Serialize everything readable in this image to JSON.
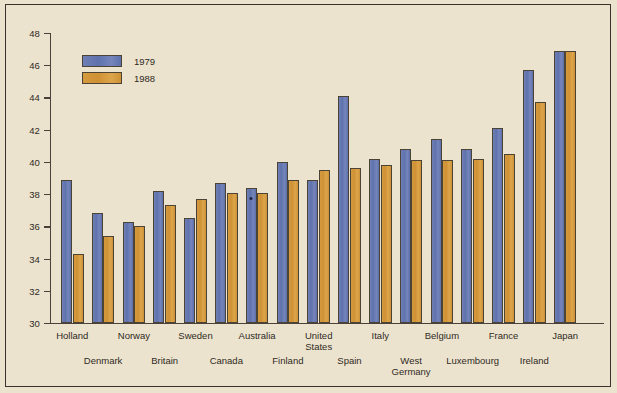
{
  "chart_data": {
    "type": "bar",
    "title": "",
    "xlabel": "",
    "ylabel": "",
    "ylim": [
      30,
      48
    ],
    "yticks": [
      30,
      32,
      34,
      36,
      38,
      40,
      42,
      44,
      46,
      48
    ],
    "grid": false,
    "legend_position": "upper-left",
    "categories": [
      "Holland",
      "Denmark",
      "Norway",
      "Britain",
      "Sweden",
      "Canada",
      "Australia",
      "Finland",
      "United\nStates",
      "Spain",
      "Italy",
      "West\nGermany",
      "Belgium",
      "Luxembourg",
      "France",
      "Ireland",
      "Japan"
    ],
    "series": [
      {
        "name": "1979",
        "color": "#6374ae",
        "values": [
          38.9,
          36.8,
          36.3,
          38.2,
          36.5,
          38.7,
          38.4,
          40.0,
          38.9,
          44.1,
          40.2,
          40.8,
          41.4,
          40.8,
          42.1,
          45.7,
          46.9
        ]
      },
      {
        "name": "1988",
        "color": "#d19638",
        "values": [
          34.3,
          35.4,
          36.0,
          37.3,
          37.7,
          38.1,
          38.1,
          38.9,
          39.5,
          39.6,
          39.8,
          40.1,
          40.1,
          40.2,
          40.5,
          43.7,
          46.9
        ]
      }
    ],
    "annotations": [
      {
        "category": "Australia",
        "series": "1979",
        "marker": "asterisk"
      }
    ]
  },
  "legend": {
    "entries": [
      {
        "label": "1979"
      },
      {
        "label": "1988"
      }
    ]
  },
  "xaxis": {
    "labels": [
      {
        "text": "Holland",
        "row": 0
      },
      {
        "text": "Denmark",
        "row": 1
      },
      {
        "text": "Norway",
        "row": 0
      },
      {
        "text": "Britain",
        "row": 1
      },
      {
        "text": "Sweden",
        "row": 0
      },
      {
        "text": "Canada",
        "row": 1
      },
      {
        "text": "Australia",
        "row": 0
      },
      {
        "text": "Finland",
        "row": 1
      },
      {
        "text": "United\nStates",
        "row": 0
      },
      {
        "text": "Spain",
        "row": 1
      },
      {
        "text": "Italy",
        "row": 0
      },
      {
        "text": "West\nGermany",
        "row": 1
      },
      {
        "text": "Belgium",
        "row": 0
      },
      {
        "text": "Luxembourg",
        "row": 1
      },
      {
        "text": "France",
        "row": 0
      },
      {
        "text": "Ireland",
        "row": 1
      },
      {
        "text": "Japan",
        "row": 0
      }
    ]
  },
  "colors": {
    "background": "#ece3cf",
    "frame": "#3a332a",
    "axis": "#4a423a",
    "series_1979": "#6374ae",
    "series_1988": "#d19638",
    "text": "#2f2a22"
  }
}
